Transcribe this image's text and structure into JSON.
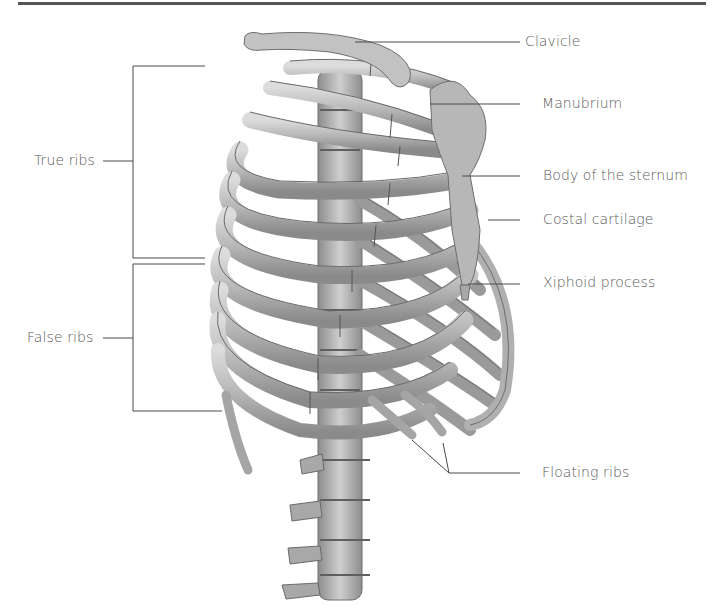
{
  "figure": {
    "labels_right": [
      {
        "id": "clavicle",
        "text": "Clavicle"
      },
      {
        "id": "manubrium",
        "text": "Manubrium"
      },
      {
        "id": "body-of-sternum",
        "text": "Body of the sternum"
      },
      {
        "id": "costal-cartilage",
        "text": "Costal cartilage"
      },
      {
        "id": "xiphoid-process",
        "text": "Xiphoid process"
      },
      {
        "id": "floating-ribs",
        "text": "Floating ribs"
      }
    ],
    "labels_left": [
      {
        "id": "true-ribs",
        "text": "True ribs"
      },
      {
        "id": "false-ribs",
        "text": "False ribs"
      }
    ],
    "colors": {
      "bone": "#bdbdbd",
      "bone_shadow": "#7d7d7d",
      "leader_line": "#4a4a4a",
      "text": "#5a5a5a",
      "rule": "#555555"
    }
  }
}
